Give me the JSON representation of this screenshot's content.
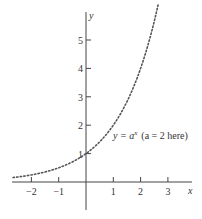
{
  "chart_data": {
    "type": "line",
    "title": "",
    "xlabel": "x",
    "ylabel": "y",
    "xlim": [
      -2.7,
      4.1
    ],
    "ylim": [
      -1.3,
      6.4
    ],
    "grid": false,
    "legend": null,
    "x_ticks": [
      -2,
      -1,
      1,
      2,
      3
    ],
    "x_tick_labels": [
      "−2",
      "−1",
      "1",
      "2",
      "3"
    ],
    "y_ticks": [
      1,
      2,
      3,
      4,
      5
    ],
    "y_tick_labels": [
      "1",
      "2",
      "3",
      "4",
      "5"
    ],
    "series": [
      {
        "name": "y = a^x (a = 2 here)",
        "style": "dotted",
        "function": "2^x",
        "x": [
          -2.67,
          -2,
          -1,
          0,
          1,
          2,
          2.5,
          2.64
        ],
        "values": [
          0.157,
          0.25,
          0.5,
          1,
          2,
          4,
          5.66,
          6.23
        ]
      }
    ],
    "annotations": [
      {
        "text_main": "y = a",
        "text_sup": "x",
        "text_rest": "(a = 2 here)",
        "x": 1.0,
        "y": 1.6
      }
    ]
  },
  "labels": {
    "x_axis": "x",
    "y_axis": "y",
    "curve_label_main": "y = a",
    "curve_label_sup": "x",
    "curve_label_paren": "(a = 2 here)"
  }
}
